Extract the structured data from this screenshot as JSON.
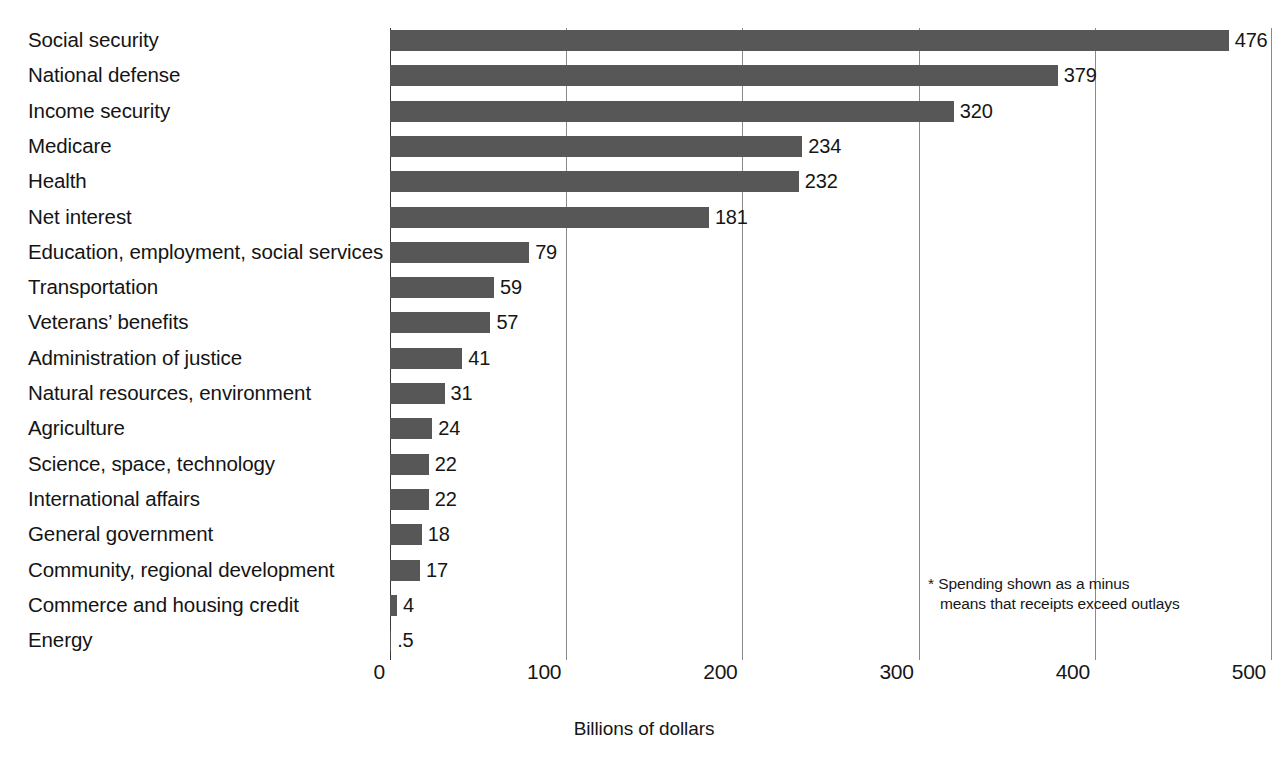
{
  "chart_data": {
    "type": "bar",
    "orientation": "horizontal",
    "title": "",
    "xlabel": "Billions of dollars",
    "ylabel": "",
    "xlim": [
      0,
      500
    ],
    "xticks": [
      "0",
      "100",
      "200",
      "300",
      "400",
      "500"
    ],
    "xtick_values": [
      0,
      100,
      200,
      300,
      400,
      500
    ],
    "grid": "vertical",
    "legend": "none",
    "bar_color": "#575758",
    "categories": [
      "Social security",
      "National defense",
      "Income security",
      "Medicare",
      "Health",
      "Net interest",
      "Education, employment, social services",
      "Transportation",
      "Veterans’ benefits",
      "Administration of justice",
      "Natural resources, environment",
      "Agriculture",
      "Science, space, technology",
      "International affairs",
      "General government",
      "Community, regional development",
      "Commerce and housing credit",
      "Energy"
    ],
    "values": [
      476,
      379,
      320,
      234,
      232,
      181,
      79,
      59,
      57,
      41,
      31,
      24,
      22,
      22,
      18,
      17,
      4,
      0.5
    ],
    "value_labels": [
      "476",
      "379",
      "320",
      "234",
      "232",
      "181",
      "79",
      "59",
      "57",
      "41",
      "31",
      "24",
      "22",
      "22",
      "18",
      "17",
      "4",
      ".5"
    ],
    "annotations": [
      "* Spending shown as a minus",
      "means that receipts exceed outlays"
    ]
  },
  "footnote": {
    "line1": "* Spending shown as a minus",
    "line2": "means that receipts exceed outlays"
  },
  "axis": {
    "x_title": "Billions of dollars"
  }
}
